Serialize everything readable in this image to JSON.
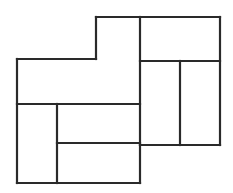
{
  "figure": {
    "canvas": {
      "width": 233,
      "height": 193
    },
    "style": {
      "background_color": "#ffffff",
      "line_color": "#2a2a2a",
      "fill_color": "#ffffff",
      "stroke_width": 2.2,
      "line_join": "miter"
    },
    "shapes": [
      {
        "name": "top-center-vertical-rectangle",
        "label": "A",
        "x": 96,
        "y": 17,
        "width": 44,
        "height": 87,
        "orientation": "vertical"
      },
      {
        "name": "top-right-horizontal-rectangle",
        "label": "B",
        "x": 140,
        "y": 17,
        "width": 80,
        "height": 44,
        "orientation": "horizontal"
      },
      {
        "name": "right-inner-vertical-rectangle",
        "label": "C",
        "x": 140,
        "y": 61,
        "width": 40,
        "height": 84,
        "orientation": "vertical"
      },
      {
        "name": "right-outer-vertical-rectangle",
        "label": "D",
        "x": 180,
        "y": 61,
        "width": 40,
        "height": 84,
        "orientation": "vertical"
      },
      {
        "name": "left-upper-horizontal-rectangle",
        "label": "E",
        "x": 17,
        "y": 59,
        "width": 79,
        "height": 45,
        "orientation": "horizontal"
      },
      {
        "name": "left-lower-vertical-rectangle",
        "label": "F",
        "x": 17,
        "y": 104,
        "width": 40,
        "height": 79,
        "orientation": "vertical"
      },
      {
        "name": "center-middle-horizontal-rectangle",
        "label": "G",
        "x": 57,
        "y": 104,
        "width": 83,
        "height": 39,
        "orientation": "horizontal"
      },
      {
        "name": "bottom-center-horizontal-rectangle",
        "label": "H",
        "x": 57,
        "y": 143,
        "width": 83,
        "height": 40,
        "orientation": "horizontal"
      }
    ],
    "segments": [
      {
        "name": "outline-top-left-vertical",
        "x1": 96,
        "y1": 17,
        "x2": 96,
        "y2": 59
      },
      {
        "name": "outline-top-edge-center",
        "x1": 96,
        "y1": 17,
        "x2": 140,
        "y2": 17
      },
      {
        "name": "outline-top-edge-right",
        "x1": 140,
        "y1": 17,
        "x2": 220,
        "y2": 17
      },
      {
        "name": "outline-right-edge",
        "x1": 220,
        "y1": 17,
        "x2": 220,
        "y2": 145
      },
      {
        "name": "outline-bottom-right-edge",
        "x1": 140,
        "y1": 145,
        "x2": 220,
        "y2": 145
      },
      {
        "name": "outline-lower-right-vertical",
        "x1": 140,
        "y1": 145,
        "x2": 140,
        "y2": 183
      },
      {
        "name": "outline-bottom-edge",
        "x1": 17,
        "y1": 183,
        "x2": 140,
        "y2": 183
      },
      {
        "name": "outline-left-edge",
        "x1": 17,
        "y1": 59,
        "x2": 17,
        "y2": 183
      },
      {
        "name": "outline-upper-left-edge",
        "x1": 17,
        "y1": 59,
        "x2": 96,
        "y2": 59
      },
      {
        "name": "interior-vertical-center",
        "x1": 140,
        "y1": 17,
        "x2": 140,
        "y2": 145
      },
      {
        "name": "interior-vertical-right-split",
        "x1": 180,
        "y1": 61,
        "x2": 180,
        "y2": 145
      },
      {
        "name": "interior-horizontal-right",
        "x1": 140,
        "y1": 61,
        "x2": 220,
        "y2": 61
      },
      {
        "name": "interior-horizontal-center",
        "x1": 17,
        "y1": 104,
        "x2": 140,
        "y2": 104
      },
      {
        "name": "interior-vertical-left-split",
        "x1": 57,
        "y1": 104,
        "x2": 57,
        "y2": 183
      },
      {
        "name": "interior-horizontal-lower",
        "x1": 57,
        "y1": 143,
        "x2": 140,
        "y2": 143
      }
    ]
  }
}
